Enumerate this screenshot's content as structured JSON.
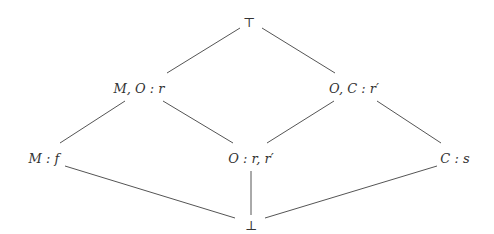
{
  "diagram": {
    "type": "lattice",
    "line_color": "#555555",
    "text_color": "#333333",
    "nodes": [
      {
        "id": "top",
        "label": "⊤",
        "x": 249,
        "y": 22
      },
      {
        "id": "mo_r",
        "label": "M, O : r",
        "x": 139,
        "y": 88
      },
      {
        "id": "oc_rp",
        "label": "O, C : r′",
        "x": 354,
        "y": 88
      },
      {
        "id": "m_f",
        "label": "M : f",
        "x": 44,
        "y": 158
      },
      {
        "id": "o_rrp",
        "label": "O : r, r′",
        "x": 251,
        "y": 158
      },
      {
        "id": "c_s",
        "label": "C : s",
        "x": 455,
        "y": 158
      },
      {
        "id": "bottom",
        "label": "⊥",
        "x": 251,
        "y": 225
      }
    ],
    "edges": [
      {
        "from": "top",
        "to": "mo_r",
        "x1": 240,
        "y1": 28,
        "x2": 167,
        "y2": 73
      },
      {
        "from": "top",
        "to": "oc_rp",
        "x1": 262,
        "y1": 28,
        "x2": 335,
        "y2": 73
      },
      {
        "from": "mo_r",
        "to": "m_f",
        "x1": 125,
        "y1": 101,
        "x2": 60,
        "y2": 143
      },
      {
        "from": "mo_r",
        "to": "o_rrp",
        "x1": 163,
        "y1": 101,
        "x2": 233,
        "y2": 143
      },
      {
        "from": "oc_rp",
        "to": "o_rrp",
        "x1": 334,
        "y1": 101,
        "x2": 267,
        "y2": 143
      },
      {
        "from": "oc_rp",
        "to": "c_s",
        "x1": 377,
        "y1": 101,
        "x2": 441,
        "y2": 143
      },
      {
        "from": "m_f",
        "to": "bottom",
        "x1": 65,
        "y1": 166,
        "x2": 235,
        "y2": 218
      },
      {
        "from": "o_rrp",
        "to": "bottom",
        "x1": 251,
        "y1": 171,
        "x2": 251,
        "y2": 215
      },
      {
        "from": "c_s",
        "to": "bottom",
        "x1": 437,
        "y1": 166,
        "x2": 265,
        "y2": 218
      }
    ]
  }
}
